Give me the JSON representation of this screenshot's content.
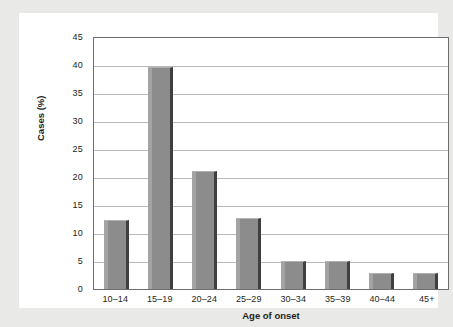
{
  "chart_data": {
    "type": "bar",
    "title": "",
    "subtitle": "",
    "xlabel": "Age of onset",
    "ylabel": "Cases (%)",
    "categories": [
      "10–14",
      "15–19",
      "20–24",
      "25–29",
      "30–34",
      "35–39",
      "40–44",
      "45+"
    ],
    "values": [
      12.4,
      39.7,
      21.0,
      12.7,
      5.0,
      5.0,
      2.8,
      2.8
    ],
    "ylim": [
      0,
      45
    ],
    "yticks": [
      0,
      5,
      10,
      15,
      20,
      25,
      30,
      35,
      40,
      45
    ],
    "ytick_labels": [
      "0",
      "5",
      "10",
      "15",
      "20",
      "25",
      "30",
      "35",
      "40",
      "45"
    ],
    "grid": "horizontal",
    "legend": "none",
    "bar_color": "#8c8c8c",
    "bar_shadow_color": "#3f3f3f",
    "gridline_color": "#b9b9b9",
    "frame_color": "#6e6e6e",
    "plot_background": "#ffffff",
    "page_background": "#e9e9e7",
    "text_color": "#231f20"
  }
}
